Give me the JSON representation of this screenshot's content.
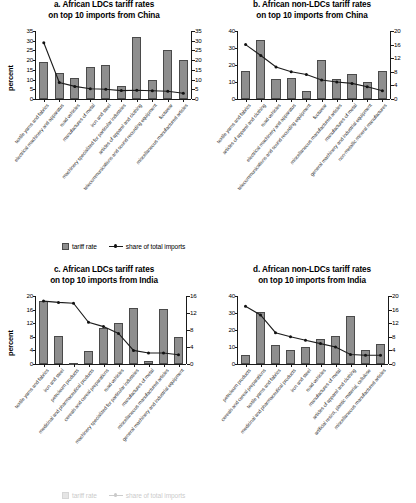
{
  "legend": {
    "bar_label": "tariff rate",
    "line_label": "share of total imports",
    "bar_swatch_color": "#8e8e8e",
    "line_color": "#1c1c1c"
  },
  "axis_titles": {
    "percent": "percent"
  },
  "chart_data": [
    {
      "id": "a",
      "type": "bar",
      "title": "a. African LDCs tariff rates\non top 10 imports from China",
      "xlabel": "",
      "ylabel": "percent",
      "ylim": [
        0,
        35
      ],
      "yticks": [
        0,
        5,
        10,
        15,
        20,
        25,
        30,
        35
      ],
      "y2lim": [
        0,
        35
      ],
      "y2ticks": [
        0,
        5,
        10,
        15,
        20,
        25,
        30,
        35
      ],
      "grid": false,
      "legend_position": "bottom",
      "categories": [
        "textile yarns and fabrics",
        "electrical machinery and apparatus",
        "road vehicles",
        "manufactures of metal",
        "iron and steel",
        "machinery specialized for particular industries",
        "articles of apparel and clothing",
        "telecommunications and sound recording equipment",
        "footwear",
        "miscellaneous manufactured articles"
      ],
      "series": [
        {
          "name": "tariff rate",
          "type": "bar",
          "axis": "left",
          "values": [
            19.0,
            13.5,
            11.0,
            16.5,
            17.5,
            6.5,
            32.0,
            10.0,
            25.0,
            20.0
          ]
        },
        {
          "name": "share of total imports",
          "type": "line",
          "axis": "right",
          "values": [
            29.0,
            8.5,
            6.5,
            5.3,
            5.0,
            4.3,
            4.5,
            4.2,
            4.0,
            3.0
          ]
        }
      ]
    },
    {
      "id": "b",
      "type": "bar",
      "title": "b. African non-LDCs tariff rates\non top 10 imports from China",
      "xlabel": "",
      "ylabel": "",
      "ylim": [
        0,
        40
      ],
      "yticks": [
        0,
        10,
        20,
        30,
        40
      ],
      "y2lim": [
        0,
        20
      ],
      "y2ticks": [
        0,
        4,
        8,
        12,
        16,
        20
      ],
      "grid": false,
      "legend_position": "bottom",
      "categories": [
        "textile yarns and fabrics",
        "articles of apparel and clothing",
        "road vehicles",
        "electrical machinery and apparatus",
        "telecommunications and sound recording equipment",
        "footwear",
        "miscellaneous manufactured articles",
        "manufactures of metal",
        "general machinery and industrial equipment",
        "non-metallic mineral manufactures"
      ],
      "series": [
        {
          "name": "tariff rate",
          "type": "bar",
          "axis": "left",
          "values": [
            16.5,
            35.0,
            11.5,
            12.5,
            5.0,
            23.0,
            11.5,
            15.0,
            10.0,
            16.5
          ]
        },
        {
          "name": "share of total imports",
          "type": "line",
          "axis": "right",
          "values": [
            16.0,
            12.8,
            9.4,
            8.0,
            7.2,
            5.6,
            5.0,
            4.6,
            3.6,
            2.4
          ]
        }
      ]
    },
    {
      "id": "c",
      "type": "bar",
      "title": "c. African LDCs tariff rates\non top 10 imports from India",
      "xlabel": "",
      "ylabel": "percent",
      "ylim": [
        0,
        20
      ],
      "yticks": [
        0,
        4,
        8,
        12,
        16,
        20
      ],
      "y2lim": [
        0,
        16
      ],
      "y2ticks": [
        0,
        4,
        8,
        12,
        16
      ],
      "grid": false,
      "legend_position": "bottom",
      "categories": [
        "textile yarns and fabrics",
        "iron and steel",
        "petroleum products",
        "medicinal and pharmaceutical products",
        "cereals and cereal preparations",
        "road vehicles",
        "machinery specialized for particular industries",
        "manufactures of metal",
        "miscellaneous manufactured articles",
        "general machinery and industrial equipment"
      ],
      "series": [
        {
          "name": "tariff rate",
          "type": "bar",
          "axis": "left",
          "values": [
            18.5,
            8.2,
            0.3,
            3.9,
            10.5,
            12.0,
            16.5,
            1.0,
            16.3,
            7.8
          ]
        },
        {
          "name": "share of total imports",
          "type": "line",
          "axis": "right",
          "values": [
            14.8,
            14.5,
            14.3,
            9.8,
            8.8,
            7.2,
            3.2,
            2.6,
            2.6,
            2.2
          ]
        }
      ]
    },
    {
      "id": "d",
      "type": "bar",
      "title": "d. African non-LDCs tariff rates\non top 10 imports from India",
      "xlabel": "",
      "ylabel": "",
      "ylim": [
        0,
        40
      ],
      "yticks": [
        0,
        10,
        20,
        30,
        40
      ],
      "y2lim": [
        0,
        20
      ],
      "y2ticks": [
        0,
        4,
        8,
        12,
        16,
        20
      ],
      "grid": false,
      "legend_position": "bottom",
      "categories": [
        "petroleum products",
        "cereals and cereal preparations",
        "textile yarns and fabrics",
        "medicinal and pharmaceutical products",
        "iron and steel",
        "road vehicles",
        "manufactures of metal",
        "articles of apparel and clothing",
        "artificial resins, plastic material, cellulose",
        "miscellaneous manufactured articles"
      ],
      "series": [
        {
          "name": "tariff rate",
          "type": "bar",
          "axis": "left",
          "values": [
            5.5,
            30.5,
            11.0,
            8.0,
            10.0,
            15.0,
            16.5,
            28.5,
            8.0,
            11.5
          ]
        },
        {
          "name": "share of total imports",
          "type": "line",
          "axis": "right",
          "values": [
            17.0,
            14.4,
            9.2,
            8.0,
            7.0,
            6.0,
            5.0,
            2.8,
            2.6,
            2.6
          ]
        }
      ]
    }
  ]
}
